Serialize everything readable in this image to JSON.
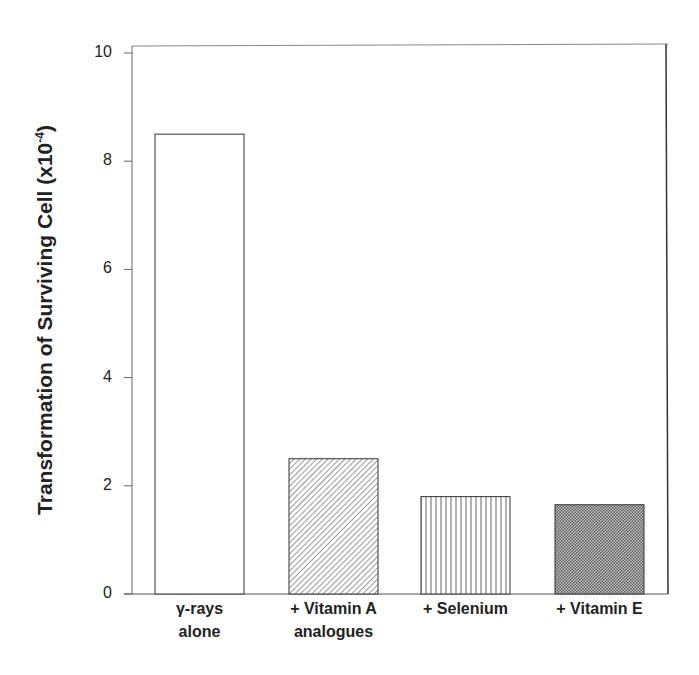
{
  "chart_data": {
    "type": "bar",
    "title": "",
    "xlabel": "",
    "ylabel": "Transformation of Surviving Cell (x10⁻⁴)",
    "ylabel_main": "Transformation of Surviving Cell (x10",
    "ylabel_exp": "-4",
    "ylabel_close": ")",
    "ylim": [
      0,
      10
    ],
    "yticks": [
      "0",
      "2",
      "4",
      "6",
      "8",
      "10"
    ],
    "categories": [
      "γ-rays alone",
      "+ Vitamin A analogues",
      "+ Selenium",
      "+ Vitamin E"
    ],
    "category_lines": [
      [
        "γ-rays",
        "alone"
      ],
      [
        "+ Vitamin A",
        "analogues"
      ],
      [
        "+ Selenium"
      ],
      [
        "+ Vitamin E"
      ]
    ],
    "values": [
      8.5,
      2.5,
      1.8,
      1.65
    ],
    "fills": [
      "none",
      "diagonal-hatch",
      "vertical-lines",
      "crosshatch"
    ],
    "grid": false,
    "legend": null
  }
}
